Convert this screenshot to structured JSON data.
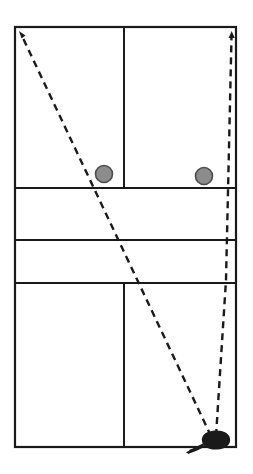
{
  "diagram": {
    "type": "court-diagram",
    "canvas": {
      "width": 253,
      "height": 474
    },
    "background_color": "#ffffff"
  },
  "colors": {
    "court_line": "#1a1a1a",
    "trajectory": "#1a1a1a",
    "shuttle_fill": "#8c8c8c",
    "shuttle_stroke": "#4d4d4d",
    "player_fill": "#1a1a1a"
  },
  "court": {
    "name": "doubles-court-outline",
    "left": 15,
    "right": 236,
    "top": 27,
    "bottom": 447,
    "line_width": 2.2,
    "lines": [
      {
        "name": "outer-boundary",
        "kind": "rect",
        "x1": 15,
        "y1": 27,
        "x2": 236,
        "y2": 447
      },
      {
        "name": "far-doubles-long-service-line",
        "kind": "horizontal",
        "y": 188,
        "x1": 15,
        "x2": 236
      },
      {
        "name": "far-short-service-line",
        "kind": "horizontal",
        "y": 240,
        "x1": 15,
        "x2": 236
      },
      {
        "name": "near-short-service-line",
        "kind": "horizontal",
        "y": 283,
        "x1": 15,
        "x2": 236
      },
      {
        "name": "far-centre-line",
        "kind": "vertical",
        "x": 124,
        "y1": 27,
        "y2": 188
      },
      {
        "name": "near-centre-line",
        "kind": "vertical",
        "x": 124,
        "y1": 283,
        "y2": 447
      }
    ]
  },
  "shuttles": [
    {
      "name": "shuttle-landing-left",
      "cx": 104,
      "cy": 174,
      "r": 9,
      "label": "left landing point"
    },
    {
      "name": "shuttle-landing-right",
      "cx": 204,
      "cy": 176,
      "r": 9,
      "label": "right landing point"
    }
  ],
  "player": {
    "name": "player-with-racket",
    "position": {
      "x": 214,
      "y": 441
    },
    "label": "striking player silhouette at near baseline"
  },
  "trajectories": [
    {
      "name": "cross-court-trajectory",
      "label": "cross-court shot to far left corner",
      "dash": "7 5",
      "width": 2.4,
      "arrow_at": "start",
      "points": [
        {
          "x": 211,
          "y": 436
        },
        {
          "x": 20,
          "y": 33
        }
      ]
    },
    {
      "name": "straight-line-trajectory",
      "label": "straight shot down the right sideline",
      "dash": "7 5",
      "width": 2.4,
      "arrow_at": "start",
      "points": [
        {
          "x": 216,
          "y": 436
        },
        {
          "x": 226,
          "y": 280
        },
        {
          "x": 232,
          "y": 33
        }
      ]
    }
  ]
}
